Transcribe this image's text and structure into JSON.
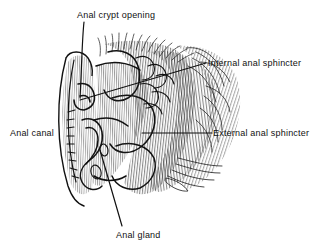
{
  "figure": {
    "background_color": "#ffffff",
    "ink_color": "#111111",
    "style": "pen-and-ink hatched medical illustration",
    "labels": [
      {
        "id": "anal-crypt-opening",
        "text": "Anal crypt opening",
        "position": "top-center"
      },
      {
        "id": "internal-anal-sphincter",
        "text": "Internal anal sphincter",
        "position": "right-upper"
      },
      {
        "id": "external-anal-sphincter",
        "text": "External anal sphincter",
        "position": "right-lower"
      },
      {
        "id": "anal-canal",
        "text": "Anal canal",
        "position": "left-middle"
      },
      {
        "id": "anal-gland",
        "text": "Anal gland",
        "position": "bottom-center"
      }
    ]
  }
}
